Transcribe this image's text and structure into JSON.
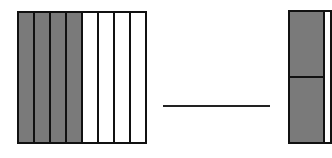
{
  "diagram": {
    "left_model": {
      "total_strips": 8,
      "shaded_strips": 4,
      "strips": [
        "shaded",
        "shaded",
        "shaded",
        "shaded",
        "blank",
        "blank",
        "blank",
        "blank"
      ]
    },
    "blank_line": "",
    "right_model": {
      "visible_cells": 2,
      "shaded_cells": 2
    },
    "colors": {
      "shaded": "#7a7a7a",
      "border": "#111111",
      "background": "#ffffff"
    }
  }
}
